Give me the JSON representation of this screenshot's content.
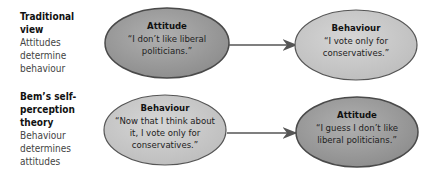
{
  "rows": [
    {
      "label_title": "Traditional view",
      "label_desc": "Attitudes determine behaviour",
      "from": {
        "heading": "Attitude",
        "quote": "“I don’t like liberal politicians.”",
        "fill": "#9a9a9a"
      },
      "to": {
        "heading": "Behaviour",
        "quote": "“I vote only for conservatives.”",
        "fill": "#c8c8c8"
      }
    },
    {
      "label_title": "Bem’s self-perception theory",
      "label_desc": "Behaviour determines attitudes",
      "from": {
        "heading": "Behaviour",
        "quote": "“Now that I think about it, I vote only for conservatives.”",
        "fill": "#c8c8c8"
      },
      "to": {
        "heading": "Attitude",
        "quote": "“I guess I don’t like liberal politicians.”",
        "fill": "#9a9a9a"
      }
    }
  ],
  "colors": {
    "dark_fill": "#9a9a9a",
    "light_fill": "#c8c8c8",
    "outline": "#4a4a4a",
    "arrow": "#555555"
  }
}
